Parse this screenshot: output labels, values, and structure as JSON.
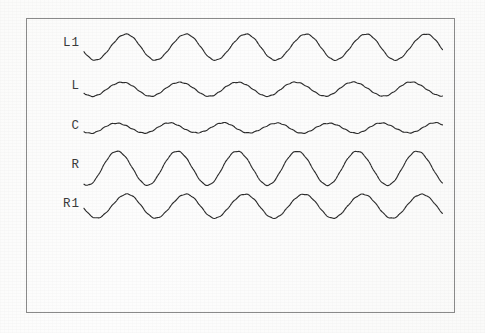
{
  "figure": {
    "title": "",
    "frame": {
      "x": 26,
      "y": 18,
      "width": 429,
      "height": 295,
      "border_color": "#8a8a8a"
    },
    "background_color": "#fdfdfc",
    "trace_color": "#2b2b2b"
  },
  "labels": {
    "l1": "L1",
    "l": "L",
    "c": "C",
    "r": "R",
    "r1": "R1"
  },
  "chart_data": {
    "type": "line",
    "title": "",
    "xlabel": "",
    "ylabel": "",
    "grid": false,
    "legend_position": "left-inline",
    "axis_visible": false,
    "x_range": [
      84,
      443
    ],
    "series": [
      {
        "name": "L1",
        "label": "L1",
        "baseline_y": 47,
        "amplitude": 13,
        "period": 60,
        "phase_deg": 200,
        "cycles": 6.0,
        "peak_values": [
          1,
          1,
          1,
          1,
          1,
          1
        ],
        "trough_values": [
          -1,
          -1,
          -1,
          -1,
          -1,
          -1
        ]
      },
      {
        "name": "L",
        "label": "L",
        "baseline_y": 89,
        "amplitude": 7,
        "period": 58,
        "phase_deg": 215,
        "cycles": 6.2,
        "peak_values": [
          1,
          1,
          1,
          1,
          1,
          1
        ],
        "trough_values": [
          -1,
          -1,
          -1,
          -1,
          -1,
          -1
        ]
      },
      {
        "name": "C",
        "label": "C",
        "baseline_y": 128,
        "amplitude": 5,
        "period": 53,
        "phase_deg": 225,
        "cycles": 6.8,
        "peak_values": [
          1,
          1,
          1,
          1,
          1,
          1,
          1
        ],
        "trough_values": [
          -1,
          -1,
          -1,
          -1,
          -1,
          -1
        ]
      },
      {
        "name": "R",
        "label": "R",
        "baseline_y": 168,
        "amplitude": 17,
        "period": 60,
        "phase_deg": 250,
        "cycles": 6.0,
        "peak_values": [
          1,
          1,
          1,
          1,
          1,
          1
        ],
        "trough_values": [
          -1,
          -1,
          -1,
          -1,
          -1,
          -1
        ]
      },
      {
        "name": "R1",
        "label": "R1",
        "baseline_y": 206,
        "amplitude": 12,
        "period": 59,
        "phase_deg": 190,
        "cycles": 6.1,
        "peak_values": [
          1,
          1,
          1,
          1,
          1,
          1
        ],
        "trough_values": [
          -1,
          -1,
          -1,
          -1,
          -1,
          -1
        ]
      }
    ]
  }
}
